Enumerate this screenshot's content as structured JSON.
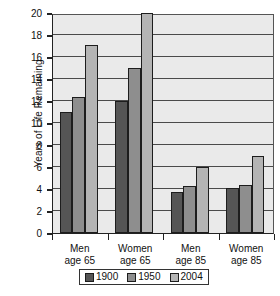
{
  "chart_data": {
    "type": "bar",
    "title": "",
    "xlabel": "",
    "ylabel": "Years of Life Remaining",
    "ylim": [
      0,
      20
    ],
    "ytick_step": 2,
    "yticks": [
      0,
      2,
      4,
      6,
      8,
      10,
      12,
      14,
      16,
      18,
      20
    ],
    "ytick_labels": [
      "0",
      "2",
      "4",
      "6",
      "8",
      "10",
      "12",
      "14",
      "16",
      "18",
      "20"
    ],
    "grid": "horizontal",
    "legend_position": "bottom",
    "categories": [
      "Men age 65",
      "Women age 65",
      "Men age 85",
      "Women age 85"
    ],
    "category_lines": [
      [
        "Men",
        "age 65"
      ],
      [
        "Women",
        "age 65"
      ],
      [
        "Men",
        "age 85"
      ],
      [
        "Women",
        "age 85"
      ]
    ],
    "series": [
      {
        "name": "1900",
        "color": "#555555",
        "values": [
          11.0,
          12.0,
          3.7,
          4.1
        ]
      },
      {
        "name": "1950",
        "color": "#8e8e8e",
        "values": [
          12.4,
          15.0,
          4.3,
          4.4
        ]
      },
      {
        "name": "2004",
        "color": "#b4b4b4",
        "values": [
          17.1,
          20.0,
          6.0,
          7.0
        ]
      }
    ]
  },
  "legend": {
    "items": [
      {
        "label": "1900",
        "color": "#555555"
      },
      {
        "label": "1950",
        "color": "#8e8e8e"
      },
      {
        "label": "2004",
        "color": "#b4b4b4"
      }
    ]
  },
  "caption": {
    "text": ""
  }
}
